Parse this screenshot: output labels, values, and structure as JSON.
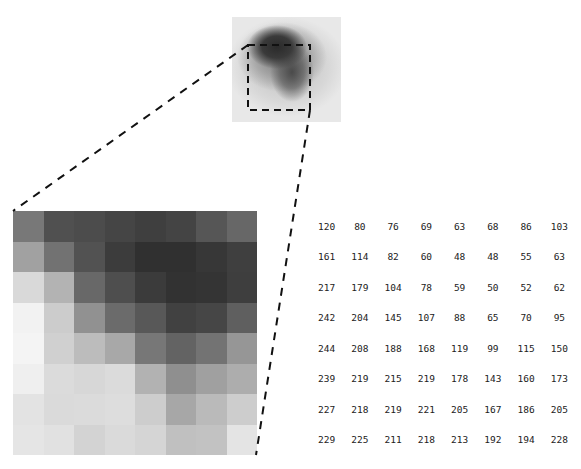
{
  "figure": {
    "grid_size": 8,
    "pixel_values": [
      [
        120,
        80,
        76,
        69,
        63,
        68,
        86,
        103
      ],
      [
        161,
        114,
        82,
        60,
        48,
        48,
        55,
        63
      ],
      [
        217,
        179,
        104,
        78,
        59,
        50,
        52,
        62
      ],
      [
        242,
        204,
        145,
        107,
        88,
        65,
        70,
        95
      ],
      [
        244,
        208,
        188,
        168,
        119,
        99,
        115,
        150
      ],
      [
        239,
        219,
        215,
        219,
        178,
        143,
        160,
        173
      ],
      [
        227,
        218,
        219,
        221,
        205,
        167,
        186,
        205
      ],
      [
        229,
        225,
        211,
        218,
        213,
        192,
        194,
        228
      ]
    ]
  },
  "colors": {
    "background": "#ffffff",
    "dash_line": "#111111",
    "text": "#222222"
  }
}
